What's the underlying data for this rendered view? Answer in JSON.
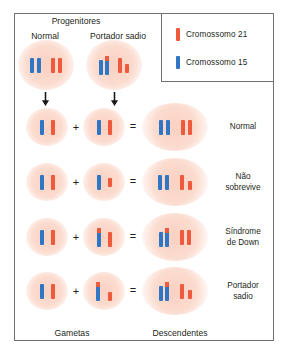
{
  "figure": {
    "headers": {
      "progenitores": "Progenitores",
      "parent_normal": "Normal",
      "parent_carrier": "Portador sadio"
    },
    "footers": {
      "gametas": "Gametas",
      "descendentes": "Descendentes"
    },
    "caption": ""
  },
  "legend": {
    "items": [
      {
        "label": "Cromossomo 21",
        "color": "#ef5a3c",
        "icon": "chromosome-red-icon"
      },
      {
        "label": "Cromossomo 15",
        "color": "#2f76c4",
        "icon": "chromosome-blue-icon"
      }
    ]
  },
  "colors": {
    "chromosome_21": "#ef5a3c",
    "chromosome_15": "#2f76c4",
    "cell_fill": "#fbd8ca",
    "frame": "#6f7072",
    "text": "#231f20"
  },
  "operators": {
    "plus": "+",
    "equals": "=",
    "arrow": "meiosis-arrow"
  },
  "parents": [
    {
      "name": "Normal",
      "karyotype_label": "2 cromossomos 15, 2 cromossomos 21",
      "chromosomes": [
        {
          "type": "15",
          "form": "normal"
        },
        {
          "type": "15",
          "form": "normal"
        },
        {
          "type": "21",
          "form": "normal"
        },
        {
          "type": "21",
          "form": "normal"
        }
      ]
    },
    {
      "name": "Portador sadio",
      "karyotype_label": "translocacao 15/21",
      "chromosomes": [
        {
          "type": "15",
          "form": "normal"
        },
        {
          "type": "15/21",
          "form": "fusion"
        },
        {
          "type": "21",
          "form": "normal"
        },
        {
          "type": "21",
          "form": "short"
        }
      ]
    }
  ],
  "crosses": [
    {
      "outcome": "Normal",
      "gamete_a": [
        {
          "type": "15",
          "form": "normal"
        },
        {
          "type": "21",
          "form": "normal"
        }
      ],
      "gamete_b": [
        {
          "type": "15",
          "form": "normal"
        },
        {
          "type": "21",
          "form": "normal"
        }
      ],
      "offspring": [
        {
          "type": "15",
          "form": "normal"
        },
        {
          "type": "15",
          "form": "normal"
        },
        {
          "type": "21",
          "form": "normal"
        },
        {
          "type": "21",
          "form": "normal"
        }
      ]
    },
    {
      "outcome": "Não\nsobrevive",
      "outcome_line1": "Não",
      "outcome_line2": "sobrevive",
      "gamete_a": [
        {
          "type": "15",
          "form": "normal"
        },
        {
          "type": "21",
          "form": "normal"
        }
      ],
      "gamete_b": [
        {
          "type": "15",
          "form": "normal"
        },
        {
          "type": "21",
          "form": "short"
        }
      ],
      "offspring": [
        {
          "type": "15",
          "form": "normal"
        },
        {
          "type": "15",
          "form": "normal"
        },
        {
          "type": "21",
          "form": "normal"
        },
        {
          "type": "21",
          "form": "short"
        }
      ]
    },
    {
      "outcome": "Síndrome\nde Down",
      "outcome_line1": "Síndrome",
      "outcome_line2": "de Down",
      "gamete_a": [
        {
          "type": "15",
          "form": "normal"
        },
        {
          "type": "21",
          "form": "normal"
        }
      ],
      "gamete_b": [
        {
          "type": "15/21",
          "form": "fusion"
        },
        {
          "type": "21",
          "form": "normal"
        }
      ],
      "offspring": [
        {
          "type": "15",
          "form": "normal"
        },
        {
          "type": "15/21",
          "form": "fusion"
        },
        {
          "type": "21",
          "form": "normal"
        },
        {
          "type": "21",
          "form": "normal"
        }
      ]
    },
    {
      "outcome": "Portador\nsadio",
      "outcome_line1": "Portador",
      "outcome_line2": "sadio",
      "gamete_a": [
        {
          "type": "15",
          "form": "normal"
        },
        {
          "type": "21",
          "form": "normal"
        }
      ],
      "gamete_b": [
        {
          "type": "15/21",
          "form": "fusion"
        },
        {
          "type": "21",
          "form": "short"
        }
      ],
      "offspring": [
        {
          "type": "15",
          "form": "normal"
        },
        {
          "type": "15/21",
          "form": "fusion"
        },
        {
          "type": "21",
          "form": "normal"
        },
        {
          "type": "21",
          "form": "short"
        }
      ]
    }
  ]
}
